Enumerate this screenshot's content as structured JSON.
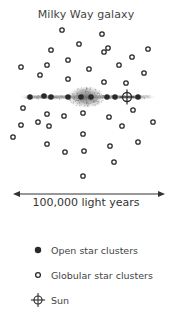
{
  "title": "Milky Way galaxy",
  "scale": {
    "label": "100,000 light years",
    "x1": 13,
    "x2": 165,
    "y": 194
  },
  "disk": {
    "x1": 20,
    "x2": 155,
    "y": 97,
    "bulge_cx": 86,
    "bulge_cy": 97,
    "bulge_rx": 15,
    "bulge_ry": 9
  },
  "open_clusters": [
    {
      "x": 30,
      "y": 97
    },
    {
      "x": 44,
      "y": 96
    },
    {
      "x": 51,
      "y": 97
    },
    {
      "x": 68,
      "y": 97
    },
    {
      "x": 81,
      "y": 97
    },
    {
      "x": 91,
      "y": 97
    },
    {
      "x": 107,
      "y": 97
    },
    {
      "x": 115,
      "y": 97
    },
    {
      "x": 138,
      "y": 97
    }
  ],
  "globular_clusters": [
    {
      "x": 62,
      "y": 30
    },
    {
      "x": 102,
      "y": 34
    },
    {
      "x": 79,
      "y": 44
    },
    {
      "x": 108,
      "y": 48
    },
    {
      "x": 104,
      "y": 52
    },
    {
      "x": 148,
      "y": 49
    },
    {
      "x": 51,
      "y": 50
    },
    {
      "x": 132,
      "y": 57
    },
    {
      "x": 68,
      "y": 60
    },
    {
      "x": 119,
      "y": 65
    },
    {
      "x": 47,
      "y": 65
    },
    {
      "x": 21,
      "y": 67
    },
    {
      "x": 89,
      "y": 69
    },
    {
      "x": 144,
      "y": 73
    },
    {
      "x": 40,
      "y": 75
    },
    {
      "x": 68,
      "y": 79
    },
    {
      "x": 104,
      "y": 82
    },
    {
      "x": 126,
      "y": 83
    },
    {
      "x": 23,
      "y": 108
    },
    {
      "x": 133,
      "y": 110
    },
    {
      "x": 83,
      "y": 113
    },
    {
      "x": 47,
      "y": 114
    },
    {
      "x": 64,
      "y": 116
    },
    {
      "x": 109,
      "y": 117
    },
    {
      "x": 38,
      "y": 122
    },
    {
      "x": 153,
      "y": 122
    },
    {
      "x": 21,
      "y": 125
    },
    {
      "x": 49,
      "y": 126
    },
    {
      "x": 122,
      "y": 126
    },
    {
      "x": 83,
      "y": 134
    },
    {
      "x": 13,
      "y": 137
    },
    {
      "x": 138,
      "y": 142
    },
    {
      "x": 47,
      "y": 144
    },
    {
      "x": 110,
      "y": 146
    },
    {
      "x": 84,
      "y": 151
    },
    {
      "x": 65,
      "y": 152
    },
    {
      "x": 114,
      "y": 162
    },
    {
      "x": 83,
      "y": 176
    }
  ],
  "sun": {
    "x": 127,
    "y": 97
  },
  "legend": {
    "items": [
      {
        "marker": "open-cluster-dot",
        "label": "Open star clusters",
        "top": 2
      },
      {
        "marker": "globular-cluster-ring",
        "label": "Globular star clusters",
        "top": 27
      },
      {
        "marker": "sun-crosshair",
        "label": "Sun",
        "top": 52
      }
    ]
  },
  "colors": {
    "ink": "#2a2a2a",
    "bulge": "#8a8a8a",
    "text": "#444444"
  }
}
